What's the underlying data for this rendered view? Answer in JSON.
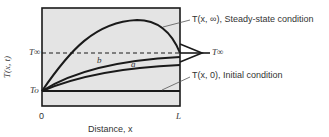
{
  "diagram": {
    "y_axis_label": "T(x, t)",
    "x_axis_label": "Distance, x",
    "x_ticks": {
      "left": "0",
      "right": "L"
    },
    "y_ticks": {
      "T_inf": "T∞",
      "T_o": "To"
    },
    "right_marker": "T∞",
    "annotations": {
      "steady_state": "T(x, ∞), Steady-state condition",
      "initial": "T(x, 0), Initial condition"
    },
    "curve_labels": {
      "a": "a",
      "b": "b"
    },
    "colors": {
      "plot_background": "#e4e4e4",
      "line": "#1a1a1a",
      "text": "#333333"
    }
  }
}
